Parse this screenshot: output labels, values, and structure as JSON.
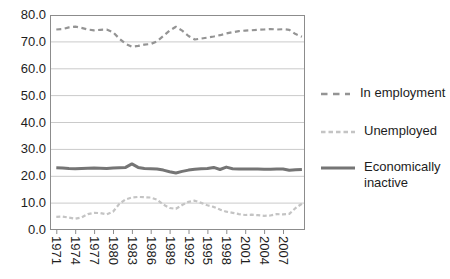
{
  "chart_data": {
    "type": "line",
    "x": [
      1971,
      1972,
      1973,
      1974,
      1975,
      1976,
      1977,
      1978,
      1979,
      1980,
      1981,
      1982,
      1983,
      1984,
      1985,
      1986,
      1987,
      1988,
      1989,
      1990,
      1991,
      1992,
      1993,
      1994,
      1995,
      1996,
      1997,
      1998,
      1999,
      2000,
      2001,
      2002,
      2003,
      2004,
      2005,
      2006,
      2007,
      2008,
      2009,
      2010
    ],
    "series": [
      {
        "id": "in-employment",
        "name": "In employment",
        "color": "#949494",
        "dash": "5 3.5",
        "width": 2.2,
        "legend_dash": "6.5 5.5",
        "legend_width": 2.6,
        "values": [
          74.6,
          74.8,
          75.4,
          75.7,
          75.2,
          74.6,
          74.3,
          74.5,
          74.6,
          73.6,
          71.2,
          69.3,
          68.2,
          68.5,
          69.0,
          69.2,
          70.2,
          72.2,
          74.2,
          75.6,
          74.2,
          72.2,
          70.9,
          71.2,
          71.6,
          72.0,
          72.5,
          73.1,
          73.6,
          74.0,
          74.2,
          74.3,
          74.5,
          74.6,
          74.8,
          74.6,
          74.7,
          74.5,
          72.9,
          71.9
        ]
      },
      {
        "id": "unemployed",
        "name": "Unemployed",
        "color": "#c4c4c4",
        "dash": "4 2.5",
        "width": 2.2,
        "legend_dash": "4.5 3",
        "legend_width": 2.6,
        "values": [
          4.9,
          5.0,
          4.6,
          4.2,
          4.7,
          5.9,
          6.4,
          6.3,
          5.8,
          6.8,
          9.7,
          11.4,
          12.1,
          12.3,
          12.2,
          12.1,
          11.3,
          9.5,
          8.2,
          7.9,
          9.3,
          10.5,
          10.9,
          10.1,
          9.2,
          8.6,
          7.6,
          6.8,
          6.4,
          5.9,
          5.6,
          5.7,
          5.5,
          5.3,
          5.4,
          5.9,
          5.8,
          6.0,
          8.2,
          9.8
        ]
      },
      {
        "id": "economically-inactive",
        "name": "Economically inactive",
        "color": "#757575",
        "dash": "none",
        "width": 3,
        "legend_dash": "none",
        "legend_width": 3.2,
        "values": [
          23.2,
          23.1,
          22.9,
          22.8,
          22.9,
          23.0,
          23.1,
          23.0,
          22.9,
          23.1,
          23.2,
          23.3,
          24.6,
          23.3,
          22.9,
          22.8,
          22.7,
          22.3,
          21.7,
          21.2,
          21.8,
          22.3,
          22.6,
          22.8,
          22.9,
          23.3,
          22.5,
          23.4,
          22.8,
          22.7,
          22.7,
          22.7,
          22.7,
          22.6,
          22.6,
          22.7,
          22.7,
          22.2,
          22.4,
          22.5
        ]
      }
    ],
    "ylim": [
      0,
      80
    ],
    "xlim": [
      1970,
      2010.5
    ],
    "y_ticks": [
      "80.0",
      "70.0",
      "60.0",
      "50.0",
      "40.0",
      "30.0",
      "20.0",
      "10.0",
      "0.0"
    ],
    "y_grid": [
      10,
      20,
      30,
      40,
      50,
      60,
      70
    ],
    "x_tick_years": [
      1971,
      1974,
      1977,
      1980,
      1983,
      1986,
      1989,
      1992,
      1995,
      1998,
      2001,
      2004,
      2007
    ],
    "x_tick_labels": [
      "1971",
      "1974",
      "1977",
      "1980",
      "1983",
      "1986",
      "1989",
      "1992",
      "1995",
      "1998",
      "2001",
      "2004",
      "2007"
    ],
    "grid": "horizontal",
    "legend_position": "right",
    "colors": {
      "grid": "#cacaca",
      "border": "#8c8c8c",
      "text": "#1d1d1d",
      "background": "#ffffff"
    }
  }
}
